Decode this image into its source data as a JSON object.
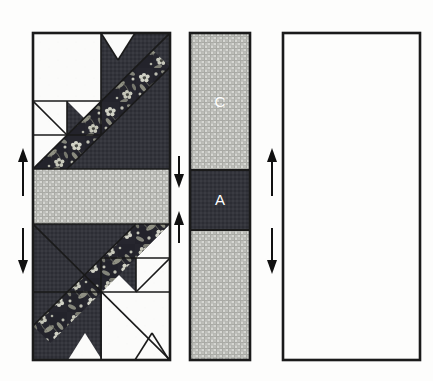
{
  "diagram": {
    "background_color": "#fdfdfc",
    "outline_color": "#1a1a1a",
    "canvas": {
      "width": 433,
      "height": 381
    }
  },
  "fabrics": [
    {
      "key": "background",
      "name": "white-solid",
      "color": "#fbfbfa",
      "description": "plain white background fabric"
    },
    {
      "key": "dark",
      "name": "dark-navy-solid",
      "color": "#32333a",
      "description": "dark charcoal navy solid"
    },
    {
      "key": "floral",
      "name": "navy-floral-print",
      "color": "#24242c",
      "accent": "#cfd0c4",
      "description": "dark navy floral print with light flowers and leaves"
    },
    {
      "key": "check",
      "name": "gray-gingham-check",
      "color": "#c9cac6",
      "grid": "#9a9b96",
      "description": "fine gray gingham checked fabric"
    }
  ],
  "panels": [
    {
      "key": "left_block",
      "name": "left-quilt-block",
      "x": 33,
      "y": 33,
      "width": 137,
      "height": 327,
      "arrows": [
        {
          "name": "press-up-arrow",
          "direction": "up",
          "x": 22,
          "y": 175
        },
        {
          "name": "press-down-arrow",
          "direction": "down",
          "x": 22,
          "y": 255
        }
      ]
    },
    {
      "key": "center_strip",
      "name": "center-sashing-strip",
      "x": 190,
      "y": 33,
      "width": 60,
      "height": 327,
      "segments": [
        {
          "key": "top",
          "label": "C",
          "fabric": "check",
          "height_ratio": 0.42
        },
        {
          "key": "middle",
          "label": "A",
          "fabric": "dark",
          "height_ratio": 0.18
        },
        {
          "key": "bottom",
          "label": "",
          "fabric": "check",
          "height_ratio": 0.4
        }
      ],
      "arrows": [
        {
          "name": "press-down-arrow",
          "direction": "down",
          "x": 178,
          "y": 185
        },
        {
          "name": "press-up-arrow",
          "direction": "up",
          "x": 178,
          "y": 235
        }
      ]
    },
    {
      "key": "right_block",
      "name": "right-quilt-block",
      "x": 283,
      "y": 33,
      "width": 137,
      "height": 327,
      "mirrored": true,
      "arrows": [
        {
          "name": "press-up-arrow",
          "direction": "up",
          "x": 272,
          "y": 175
        },
        {
          "name": "press-down-arrow",
          "direction": "down",
          "x": 272,
          "y": 255
        }
      ]
    }
  ],
  "labels": {
    "patch_c": "C",
    "patch_a": "A"
  },
  "patch_letters": [
    {
      "letter": "C",
      "x": 220,
      "y": 103,
      "on_fabric": "gray-gingham-check"
    },
    {
      "letter": "A",
      "x": 220,
      "y": 200,
      "on_fabric": "dark-navy-solid"
    }
  ]
}
